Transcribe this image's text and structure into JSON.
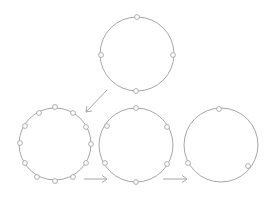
{
  "diagram": {
    "stroke_color": "#a6a6a6",
    "background": "#ffffff",
    "rings": [
      {
        "id": "top-ring",
        "cx": 137,
        "cy": 54,
        "r": 37,
        "nodes": [
          {
            "x": 137,
            "y": 17
          },
          {
            "x": 101,
            "y": 55
          },
          {
            "x": 173,
            "y": 55
          },
          {
            "x": 136,
            "y": 91
          }
        ]
      },
      {
        "id": "left-ring",
        "cx": 55,
        "cy": 144,
        "r": 36,
        "nodes": [
          {
            "x": 55,
            "y": 107
          },
          {
            "x": 73,
            "y": 113
          },
          {
            "x": 86,
            "y": 127
          },
          {
            "x": 91,
            "y": 144
          },
          {
            "x": 86,
            "y": 163
          },
          {
            "x": 73,
            "y": 177
          },
          {
            "x": 55,
            "y": 181
          },
          {
            "x": 37,
            "y": 177
          },
          {
            "x": 25,
            "y": 163
          },
          {
            "x": 20,
            "y": 143
          },
          {
            "x": 25,
            "y": 126
          },
          {
            "x": 39,
            "y": 113
          }
        ]
      },
      {
        "id": "middle-ring",
        "cx": 136,
        "cy": 145,
        "r": 37,
        "nodes": [
          {
            "x": 136,
            "y": 108
          },
          {
            "x": 167,
            "y": 127
          },
          {
            "x": 167,
            "y": 164
          },
          {
            "x": 136,
            "y": 182
          },
          {
            "x": 105,
            "y": 163
          },
          {
            "x": 107,
            "y": 126
          }
        ]
      },
      {
        "id": "right-ring",
        "cx": 221,
        "cy": 145,
        "r": 37,
        "nodes": [
          {
            "x": 219,
            "y": 109
          },
          {
            "x": 248,
            "y": 166
          },
          {
            "x": 188,
            "y": 163
          }
        ]
      }
    ],
    "arrows": [
      {
        "id": "arrow-top-to-left",
        "x1": 107,
        "y1": 90,
        "x2": 86,
        "y2": 112
      },
      {
        "id": "arrow-left-to-middle",
        "x1": 84,
        "y1": 179,
        "x2": 107,
        "y2": 179
      },
      {
        "id": "arrow-middle-to-right",
        "x1": 163,
        "y1": 179,
        "x2": 187,
        "y2": 179
      }
    ]
  }
}
